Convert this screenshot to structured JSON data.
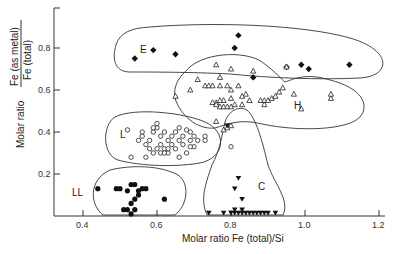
{
  "chart_data": {
    "type": "scatter",
    "title": "",
    "xlabel": "Molar ratio Fe (total)/Si",
    "ylabel_prefix": "Molar ratio",
    "ylabel_numerator": "Fe (as metal)",
    "ylabel_denominator": "Fe (total)",
    "xlim": [
      0.33,
      1.22
    ],
    "ylim": [
      0,
      0.98
    ],
    "xticks": [
      0.4,
      0.6,
      0.8,
      1.0,
      1.2
    ],
    "xtick_labels": [
      "0.4",
      "0.6",
      "0.8",
      "1.0",
      "1.2"
    ],
    "yticks": [
      0.2,
      0.4,
      0.6,
      0.8
    ],
    "ytick_labels": [
      "0.2",
      "0.4",
      "0.6",
      "0.8"
    ],
    "grid": false,
    "legend": "none (groups labeled inline)",
    "series": [
      {
        "name": "E",
        "marker": "filled-diamond",
        "points": [
          [
            0.54,
            0.75
          ],
          [
            0.59,
            0.79
          ],
          [
            0.65,
            0.77
          ],
          [
            0.82,
            0.86
          ],
          [
            0.81,
            0.8
          ],
          [
            0.95,
            0.71
          ],
          [
            0.99,
            0.72
          ],
          [
            1.01,
            0.7
          ],
          [
            1.12,
            0.72
          ],
          [
            0.86,
            0.66
          ]
        ]
      },
      {
        "name": "H",
        "marker": "open-triangle",
        "points": [
          [
            0.69,
            0.6
          ],
          [
            0.77,
            0.66
          ],
          [
            0.71,
            0.65
          ],
          [
            0.73,
            0.62
          ],
          [
            0.74,
            0.62
          ],
          [
            0.75,
            0.62
          ],
          [
            0.77,
            0.62
          ],
          [
            0.79,
            0.62
          ],
          [
            0.82,
            0.62
          ],
          [
            0.8,
            0.6
          ],
          [
            0.84,
            0.58
          ],
          [
            0.83,
            0.57
          ],
          [
            0.8,
            0.56
          ],
          [
            0.78,
            0.55
          ],
          [
            0.77,
            0.55
          ],
          [
            0.76,
            0.54
          ],
          [
            0.75,
            0.54
          ],
          [
            0.76,
            0.53
          ],
          [
            0.77,
            0.52
          ],
          [
            0.78,
            0.52
          ],
          [
            0.79,
            0.52
          ],
          [
            0.8,
            0.52
          ],
          [
            0.81,
            0.53
          ],
          [
            0.83,
            0.53
          ],
          [
            0.85,
            0.55
          ],
          [
            0.88,
            0.55
          ],
          [
            0.89,
            0.55
          ],
          [
            0.9,
            0.55
          ],
          [
            0.91,
            0.56
          ],
          [
            0.92,
            0.57
          ],
          [
            0.93,
            0.59
          ],
          [
            0.94,
            0.61
          ],
          [
            0.89,
            0.53
          ],
          [
            0.97,
            0.58
          ],
          [
            0.99,
            0.51
          ],
          [
            1.07,
            0.56
          ],
          [
            1.07,
            0.58
          ],
          [
            0.95,
            0.71
          ],
          [
            0.86,
            0.69
          ],
          [
            0.8,
            0.7
          ],
          [
            0.76,
            0.72
          ],
          [
            0.65,
            0.57
          ],
          [
            0.76,
            0.45
          ],
          [
            0.78,
            0.41
          ],
          [
            0.79,
            0.42
          ],
          [
            0.8,
            0.43
          ]
        ]
      },
      {
        "name": "L",
        "marker": "open-circle",
        "points": [
          [
            0.52,
            0.41
          ],
          [
            0.53,
            0.28
          ],
          [
            0.57,
            0.28
          ],
          [
            0.55,
            0.36
          ],
          [
            0.56,
            0.38
          ],
          [
            0.57,
            0.34
          ],
          [
            0.58,
            0.36
          ],
          [
            0.59,
            0.4
          ],
          [
            0.6,
            0.42
          ],
          [
            0.6,
            0.44
          ],
          [
            0.61,
            0.38
          ],
          [
            0.61,
            0.34
          ],
          [
            0.62,
            0.4
          ],
          [
            0.62,
            0.32
          ],
          [
            0.63,
            0.36
          ],
          [
            0.63,
            0.3
          ],
          [
            0.64,
            0.38
          ],
          [
            0.64,
            0.34
          ],
          [
            0.65,
            0.32
          ],
          [
            0.65,
            0.4
          ],
          [
            0.66,
            0.36
          ],
          [
            0.66,
            0.42
          ],
          [
            0.67,
            0.38
          ],
          [
            0.67,
            0.34
          ],
          [
            0.68,
            0.41
          ],
          [
            0.68,
            0.3
          ],
          [
            0.69,
            0.36
          ],
          [
            0.69,
            0.4
          ],
          [
            0.7,
            0.33
          ],
          [
            0.7,
            0.38
          ],
          [
            0.71,
            0.36
          ],
          [
            0.58,
            0.32
          ],
          [
            0.59,
            0.3
          ],
          [
            0.6,
            0.32
          ],
          [
            0.61,
            0.3
          ],
          [
            0.62,
            0.3
          ],
          [
            0.63,
            0.32
          ],
          [
            0.66,
            0.28
          ],
          [
            0.69,
            0.33
          ],
          [
            0.73,
            0.36
          ],
          [
            0.73,
            0.38
          ],
          [
            0.8,
            0.33
          ],
          [
            0.56,
            0.4
          ],
          [
            0.59,
            0.42
          ]
        ]
      },
      {
        "name": "LL",
        "marker": "filled-circle",
        "points": [
          [
            0.44,
            0.13
          ],
          [
            0.49,
            0.13
          ],
          [
            0.5,
            0.13
          ],
          [
            0.52,
            0.12
          ],
          [
            0.53,
            0.15
          ],
          [
            0.54,
            0.15
          ],
          [
            0.55,
            0.12
          ],
          [
            0.56,
            0.13
          ],
          [
            0.55,
            0.1
          ],
          [
            0.54,
            0.08
          ],
          [
            0.53,
            0.06
          ],
          [
            0.51,
            0.03
          ],
          [
            0.52,
            0.03
          ],
          [
            0.54,
            0.03
          ],
          [
            0.57,
            0.13
          ],
          [
            0.62,
            0.08
          ],
          [
            0.53,
            0.01
          ]
        ]
      },
      {
        "name": "C",
        "marker": "filled-inverted-triangle",
        "points": [
          [
            0.74,
            0.0
          ],
          [
            0.78,
            0.0
          ],
          [
            0.8,
            0.0
          ],
          [
            0.81,
            0.01
          ],
          [
            0.82,
            0.0
          ],
          [
            0.83,
            0.0
          ],
          [
            0.84,
            0.0
          ],
          [
            0.85,
            0.0
          ],
          [
            0.86,
            0.0
          ],
          [
            0.87,
            0.0
          ],
          [
            0.88,
            0.0
          ],
          [
            0.89,
            0.0
          ],
          [
            0.9,
            0.0
          ],
          [
            0.92,
            0.0
          ],
          [
            0.81,
            0.03
          ],
          [
            0.83,
            0.03
          ],
          [
            0.83,
            0.08
          ],
          [
            0.81,
            0.13
          ],
          [
            0.82,
            0.18
          ],
          [
            0.79,
            0.43
          ]
        ]
      }
    ],
    "groups": [
      "E",
      "H",
      "L",
      "LL",
      "C"
    ]
  },
  "labels": {
    "E": "E",
    "H": "H",
    "L": "L",
    "LL": "LL",
    "C": "C",
    "xlabel": "Molar ratio Fe (total)/Si",
    "ylabel_prefix": "Molar ratio",
    "ylabel_numerator": "Fe (as metal)",
    "ylabel_denominator": "Fe (total)"
  }
}
